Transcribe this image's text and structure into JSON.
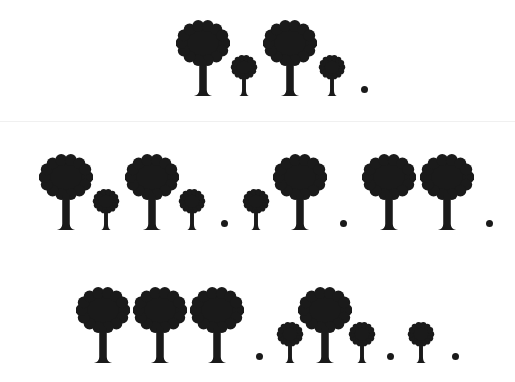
{
  "colors": {
    "ink": "#1a1a1a",
    "background": "#ffffff",
    "divider": "#f0f0f0"
  },
  "rows": [
    {
      "name": "pattern-row-1",
      "sequence": [
        "big-tree",
        "small-tree",
        "big-tree",
        "small-tree",
        "dot"
      ],
      "items": [
        {
          "type": "big",
          "x": 176
        },
        {
          "type": "small",
          "x": 230
        },
        {
          "type": "big",
          "x": 263
        },
        {
          "type": "small",
          "x": 318
        },
        {
          "type": "dot",
          "x": 361
        }
      ]
    },
    {
      "name": "pattern-row-2",
      "sequence": [
        "big-tree",
        "small-tree",
        "big-tree",
        "small-tree",
        "dot",
        "small-tree",
        "big-tree",
        "dot",
        "big-tree",
        "big-tree",
        "dot"
      ],
      "items": [
        {
          "type": "big",
          "x": 39
        },
        {
          "type": "small",
          "x": 92
        },
        {
          "type": "big",
          "x": 125
        },
        {
          "type": "small",
          "x": 178
        },
        {
          "type": "dot",
          "x": 221
        },
        {
          "type": "small",
          "x": 242
        },
        {
          "type": "big",
          "x": 273
        },
        {
          "type": "dot",
          "x": 340
        },
        {
          "type": "big",
          "x": 362
        },
        {
          "type": "big",
          "x": 420
        },
        {
          "type": "dot",
          "x": 486
        }
      ]
    },
    {
      "name": "pattern-row-3",
      "sequence": [
        "big-tree",
        "big-tree",
        "big-tree",
        "dot",
        "small-tree",
        "big-tree",
        "small-tree",
        "dot",
        "small-tree",
        "dot"
      ],
      "items": [
        {
          "type": "big",
          "x": 76
        },
        {
          "type": "big",
          "x": 133
        },
        {
          "type": "big",
          "x": 190
        },
        {
          "type": "dot",
          "x": 256
        },
        {
          "type": "small",
          "x": 276
        },
        {
          "type": "big",
          "x": 298
        },
        {
          "type": "small",
          "x": 348
        },
        {
          "type": "dot",
          "x": 387
        },
        {
          "type": "small",
          "x": 407
        },
        {
          "type": "dot",
          "x": 452
        }
      ]
    }
  ],
  "row_layout": [
    {
      "top": 20,
      "height": 76
    },
    {
      "top": 154,
      "height": 76
    },
    {
      "top": 287,
      "height": 76
    }
  ]
}
